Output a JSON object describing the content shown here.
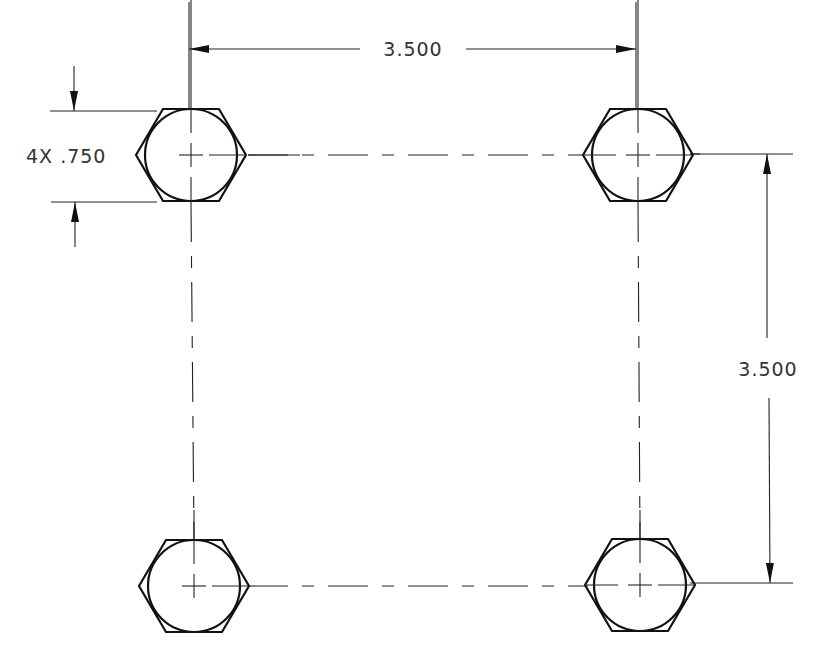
{
  "drawing": {
    "type": "bolt-hole-pattern",
    "hole_count": 4,
    "holes": [
      {
        "id": "top-left",
        "cx": 191,
        "cy": 155
      },
      {
        "id": "top-right",
        "cx": 638,
        "cy": 155
      },
      {
        "id": "bottom-left",
        "cx": 194,
        "cy": 586
      },
      {
        "id": "bottom-right",
        "cx": 640,
        "cy": 585
      }
    ],
    "dimensions": {
      "horizontal_spacing": "3.500",
      "vertical_spacing": "3.500",
      "hole_size_label": "4X .750"
    },
    "colors": {
      "line": "#111111",
      "text": "#333333",
      "background": "#ffffff"
    }
  }
}
